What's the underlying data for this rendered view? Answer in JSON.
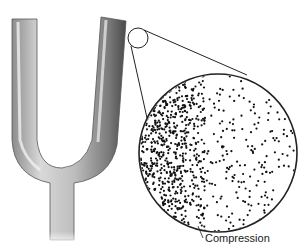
{
  "diagram": {
    "magnifier": {
      "small_circle": {
        "cx": 138,
        "cy": 38,
        "r": 10
      },
      "large_circle": {
        "cx": 218,
        "cy": 153,
        "r": 79
      }
    },
    "labels": {
      "compression": "Compression"
    },
    "colors": {
      "metal_dark": "#5a5a5a",
      "metal_mid": "#a8a8a8",
      "metal_light": "#e6e6e6",
      "line": "#222222",
      "particle": "#111111"
    }
  }
}
